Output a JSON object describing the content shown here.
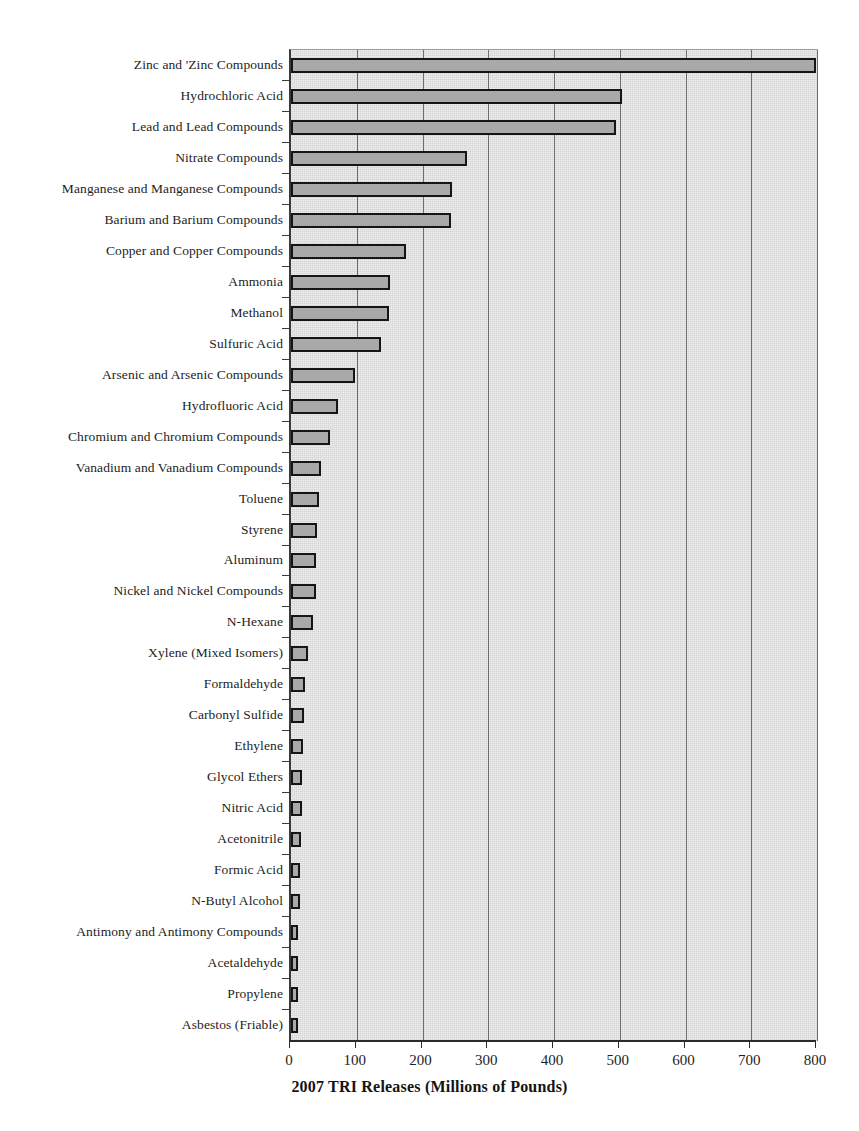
{
  "chart_data": {
    "type": "bar",
    "orientation": "horizontal",
    "title": "",
    "subtitle": "",
    "xlabel": "2007 TRI Releases (Millions of Pounds)",
    "ylabel": "",
    "xlim": [
      0,
      800
    ],
    "ylim": null,
    "xticks": [
      0,
      100,
      200,
      300,
      400,
      500,
      600,
      700,
      800
    ],
    "xtick_labels": [
      "0",
      "100",
      "200",
      "300",
      "400",
      "500",
      "600",
      "700",
      "800"
    ],
    "grid": "vertical",
    "legend": null,
    "annotations": [],
    "categories": [
      "Zinc and 'Zinc Compounds",
      "Hydrochloric Acid",
      "Lead and Lead Compounds",
      "Nitrate Compounds",
      "Manganese and Manganese Compounds",
      "Barium and Barium Compounds",
      "Copper and Copper Compounds",
      "Ammonia",
      "Methanol",
      "Sulfuric Acid",
      "Arsenic and Arsenic Compounds",
      "Hydrofluoric Acid",
      "Chromium and Chromium Compounds",
      "Vanadium and Vanadium Compounds",
      "Toluene",
      "Styrene",
      "Aluminum",
      "Nickel and Nickel Compounds",
      "N-Hexane",
      "Xylene (Mixed Isomers)",
      "Formaldehyde",
      "Carbonyl Sulfide",
      "Ethylene",
      "Glycol Ethers",
      "Nitric Acid",
      "Acetonitrile",
      "Formic Acid",
      "N-Butyl Alcohol",
      "Antimony and Antimony Compounds",
      "Acetaldehyde",
      "Propylene",
      "Asbestos (Friable)"
    ],
    "values": [
      798,
      503,
      495,
      268,
      245,
      244,
      175,
      151,
      149,
      137,
      97,
      72,
      60,
      45,
      42,
      39,
      38,
      38,
      34,
      26,
      21,
      20,
      18,
      17,
      16,
      15,
      13,
      13,
      11,
      10,
      10,
      9
    ],
    "units": "Millions of Pounds",
    "colors": {
      "bar_fill": "#a9a9a9",
      "bar_edge": "#151515",
      "panel_background": "#d4d4d4",
      "gridline": "#6e6e6e",
      "axis": "#2b2b2b",
      "text": "#1d1d1d",
      "page_background": "#ffffff"
    }
  }
}
